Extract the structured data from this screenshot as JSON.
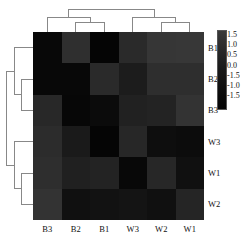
{
  "chart_data": {
    "type": "heatmap",
    "title": "",
    "xlabel": "",
    "ylabel": "",
    "column_labels": [
      "B3",
      "B2",
      "B1",
      "W3",
      "W2",
      "W1"
    ],
    "row_labels": [
      "B1",
      "B2",
      "B3",
      "W3",
      "W1",
      "W2"
    ],
    "colorbar": {
      "ticks": [
        "1.5",
        "1.0",
        "0.5",
        "0.0",
        "-1.5",
        "-1.0",
        "-1.5"
      ],
      "scheme": "grayscale-dark",
      "low_color": "#050505",
      "high_color": "#3a3a3a",
      "position": "right"
    },
    "legend_position": "right",
    "grid": false,
    "dendrogram_top": true,
    "dendrogram_left": true,
    "matrix": [
      [
        0.05,
        1.1,
        0.02,
        0.95,
        1.25,
        1.3
      ],
      [
        0.05,
        0.05,
        0.95,
        0.6,
        1.05,
        1.05
      ],
      [
        0.9,
        0.05,
        0.1,
        0.7,
        0.75,
        1.15
      ],
      [
        1.0,
        0.55,
        0.02,
        0.85,
        0.2,
        0.15
      ],
      [
        1.05,
        0.7,
        0.75,
        0.05,
        0.85,
        0.25
      ],
      [
        1.15,
        0.25,
        0.3,
        0.35,
        0.25,
        0.8
      ]
    ],
    "cell_colors": [
      [
        "#080808",
        "#2f2f2f",
        "#050505",
        "#2a2a2a",
        "#363636",
        "#373737"
      ],
      [
        "#080808",
        "#080808",
        "#2a2a2a",
        "#1c1c1c",
        "#2e2e2e",
        "#2e2e2e"
      ],
      [
        "#282828",
        "#070707",
        "#0b0b0b",
        "#212121",
        "#232323",
        "#333333"
      ],
      [
        "#2c2c2c",
        "#1a1a1a",
        "#050505",
        "#272727",
        "#0e0e0e",
        "#0c0c0c"
      ],
      [
        "#2e2e2e",
        "#202020",
        "#232323",
        "#080808",
        "#272727",
        "#101010"
      ],
      [
        "#333333",
        "#101010",
        "#121212",
        "#141414",
        "#101010",
        "#252525"
      ]
    ]
  }
}
